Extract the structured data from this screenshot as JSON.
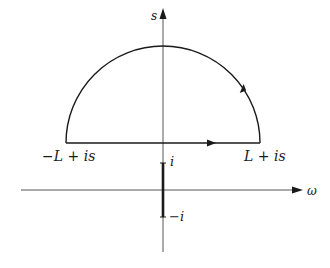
{
  "diagram": {
    "type": "contour-integral",
    "axes": {
      "vertical_label": "s",
      "horizontal_label": "ω"
    },
    "contour": {
      "shape": "closed semicircle",
      "left_endpoint_label": "−L + is",
      "right_endpoint_label": "L + is",
      "orientation": "counterclockwise"
    },
    "branch_cut": {
      "top_label": "i",
      "bottom_label": "−i"
    },
    "colors": {
      "stroke": "#1a1a1a",
      "axis": "#555555"
    }
  }
}
